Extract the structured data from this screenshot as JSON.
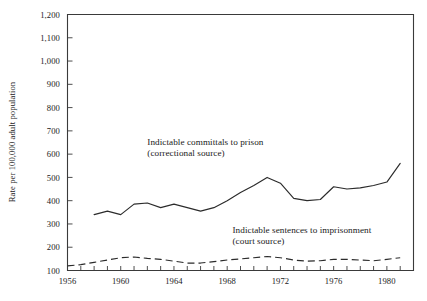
{
  "chart_data": {
    "type": "line",
    "title": "",
    "xlabel": "",
    "ylabel": "Rate per 100,000 adult population",
    "xlim": [
      1956,
      1982
    ],
    "ylim": [
      100,
      1200
    ],
    "grid": false,
    "legend_position": "inline-annotation",
    "y_ticks": [
      100,
      200,
      300,
      400,
      500,
      600,
      700,
      800,
      900,
      1000,
      1100,
      1200
    ],
    "y_tick_labels": [
      "100",
      "200",
      "300",
      "400",
      "500",
      "600",
      "700",
      "800",
      "900",
      "1,000",
      "1,100",
      "1,200"
    ],
    "x_ticks": [
      1956,
      1957,
      1958,
      1959,
      1960,
      1961,
      1962,
      1963,
      1964,
      1965,
      1966,
      1967,
      1968,
      1969,
      1970,
      1971,
      1972,
      1973,
      1974,
      1975,
      1976,
      1977,
      1978,
      1979,
      1980,
      1981,
      1982
    ],
    "x_tick_labels": [
      "1956",
      "1960",
      "1964",
      "1968",
      "1972",
      "1976",
      "1980"
    ],
    "x_labeled_ticks": [
      1956,
      1960,
      1964,
      1968,
      1972,
      1976,
      1980
    ],
    "series": [
      {
        "name": "Indictable committals to prison (correctional source)",
        "style": "solid",
        "color": "#2b2b2b",
        "x": [
          1958,
          1959,
          1960,
          1961,
          1962,
          1963,
          1964,
          1965,
          1966,
          1967,
          1968,
          1969,
          1970,
          1971,
          1972,
          1973,
          1974,
          1975,
          1976,
          1977,
          1978,
          1979,
          1980,
          1981
        ],
        "values": [
          340,
          355,
          340,
          385,
          390,
          370,
          385,
          370,
          355,
          370,
          400,
          435,
          465,
          500,
          475,
          410,
          400,
          405,
          460,
          450,
          455,
          465,
          480,
          560
        ]
      },
      {
        "name": "Indictable sentences to imprisonment (court source)",
        "style": "dashed",
        "color": "#2b2b2b",
        "x": [
          1956,
          1957,
          1958,
          1959,
          1960,
          1961,
          1962,
          1963,
          1964,
          1965,
          1966,
          1967,
          1968,
          1969,
          1970,
          1971,
          1972,
          1973,
          1974,
          1975,
          1976,
          1977,
          1978,
          1979,
          1980,
          1981
        ],
        "values": [
          120,
          125,
          135,
          145,
          155,
          158,
          152,
          148,
          140,
          132,
          132,
          138,
          145,
          150,
          155,
          160,
          155,
          145,
          140,
          142,
          148,
          148,
          145,
          142,
          148,
          155
        ]
      }
    ],
    "annotations": [
      {
        "id": "annotation-correctional",
        "line1": "Indictable committals  to prison",
        "line2": "(correctional source)",
        "x": 1962.0,
        "y": 640
      },
      {
        "id": "annotation-court",
        "line1": "Indictable sentences to imprisonment",
        "line2": "(court source)",
        "x": 1968.4,
        "y": 260
      }
    ]
  }
}
